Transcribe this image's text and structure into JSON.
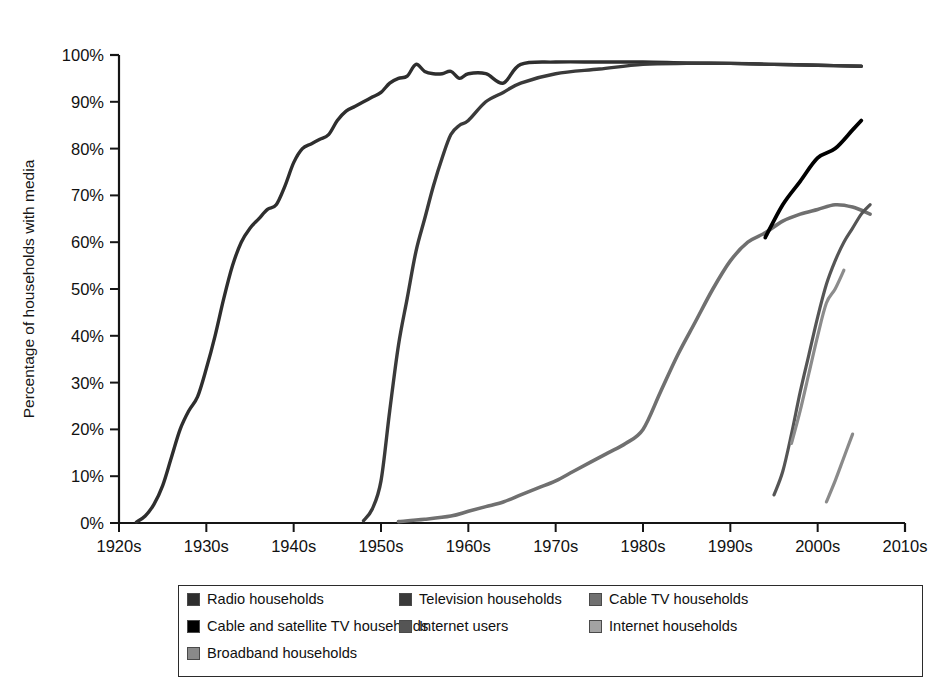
{
  "chart_data": {
    "type": "line",
    "title": "",
    "subtitle": "",
    "xlabel": "",
    "ylabel": "Percentage of households with media",
    "xlim": [
      1920,
      2010
    ],
    "ylim": [
      0,
      100
    ],
    "grid": false,
    "legend_position": "bottom",
    "x_tick_labels": [
      "1920s",
      "1930s",
      "1940s",
      "1950s",
      "1960s",
      "1970s",
      "1980s",
      "1990s",
      "2000s",
      "2010s"
    ],
    "x_tick_values": [
      1920,
      1930,
      1940,
      1950,
      1960,
      1970,
      1980,
      1990,
      2000,
      2010
    ],
    "y_tick_labels": [
      "0%",
      "10%",
      "20%",
      "30%",
      "40%",
      "50%",
      "60%",
      "70%",
      "80%",
      "90%",
      "100%"
    ],
    "y_tick_values": [
      0,
      10,
      20,
      30,
      40,
      50,
      60,
      70,
      80,
      90,
      100
    ],
    "series": [
      {
        "name": "Radio households",
        "color": "#2e2e2e",
        "width": 3.4,
        "x": [
          1922,
          1923,
          1924,
          1925,
          1926,
          1927,
          1928,
          1929,
          1930,
          1931,
          1932,
          1933,
          1934,
          1935,
          1936,
          1937,
          1938,
          1939,
          1940,
          1941,
          1942,
          1943,
          1944,
          1945,
          1946,
          1947,
          1948,
          1949,
          1950,
          1951,
          1952,
          1953,
          1954,
          1955,
          1956,
          1957,
          1958,
          1959,
          1960,
          1962,
          1964,
          1966,
          1970,
          1975,
          1980,
          1985,
          1990,
          1995,
          2000,
          2005
        ],
        "y": [
          0.2,
          1.5,
          4,
          8,
          14,
          20,
          24,
          27,
          33,
          40,
          48,
          55,
          60,
          63,
          65,
          67,
          68,
          72,
          77,
          80,
          81,
          82,
          83,
          86,
          88,
          89,
          90,
          91,
          92,
          94,
          95,
          95.5,
          98,
          96.5,
          96,
          96,
          96.5,
          95,
          96,
          96,
          94,
          98,
          98.5,
          98.5,
          98.5,
          98.3,
          98.2,
          98,
          97.8,
          97.6
        ]
      },
      {
        "name": "Television households",
        "color": "#3a3a3a",
        "width": 3.4,
        "x": [
          1948,
          1949,
          1950,
          1951,
          1952,
          1953,
          1954,
          1955,
          1956,
          1957,
          1958,
          1959,
          1960,
          1962,
          1964,
          1966,
          1970,
          1975,
          1980,
          1985,
          1990,
          1995,
          2000,
          2005
        ],
        "y": [
          0.5,
          3,
          9,
          24,
          38,
          48,
          58,
          65,
          72,
          78,
          83,
          85,
          86,
          90,
          92,
          94,
          96,
          97,
          98,
          98.2,
          98.2,
          98,
          97.8,
          97.6
        ]
      },
      {
        "name": "Cable TV households",
        "color": "#707070",
        "width": 3.6,
        "x": [
          1952,
          1955,
          1958,
          1960,
          1962,
          1964,
          1966,
          1968,
          1970,
          1972,
          1974,
          1976,
          1978,
          1980,
          1982,
          1984,
          1986,
          1988,
          1990,
          1992,
          1994,
          1996,
          1998,
          2000,
          2002,
          2004,
          2006
        ],
        "y": [
          0.3,
          0.8,
          1.5,
          2.5,
          3.5,
          4.5,
          6,
          7.5,
          9,
          11,
          13,
          15,
          17,
          20,
          28,
          36,
          43,
          50,
          56,
          60,
          62,
          64.5,
          66,
          67,
          68,
          67.5,
          66
        ]
      },
      {
        "name": "Cable and satellite TV households",
        "color": "#000000",
        "width": 3.8,
        "x": [
          1994,
          1996,
          1998,
          2000,
          2002,
          2004,
          2005
        ],
        "y": [
          61,
          68,
          73,
          78,
          80,
          84,
          86
        ]
      },
      {
        "name": "Internet users",
        "color": "#555555",
        "width": 3.2,
        "x": [
          1995,
          1996,
          1997,
          1998,
          1999,
          2000,
          2001,
          2002,
          2003,
          2004,
          2005,
          2006
        ],
        "y": [
          6,
          11,
          19,
          28,
          36,
          44,
          51,
          56,
          60,
          63,
          66,
          68
        ]
      },
      {
        "name": "Internet households",
        "color": "#8c8c8c",
        "width": 3.2,
        "x": [
          1997,
          1998,
          1999,
          2000,
          2001,
          2002,
          2003
        ],
        "y": [
          17,
          24,
          32,
          40,
          47,
          50,
          54
        ]
      },
      {
        "name": "Broadband households",
        "color": "#8a8a8a",
        "width": 3.2,
        "x": [
          2001,
          2002,
          2003,
          2004
        ],
        "y": [
          4.5,
          9,
          14,
          19
        ]
      }
    ]
  },
  "legend": {
    "rows": [
      [
        {
          "label": "Radio households",
          "color": "#2e2e2e"
        },
        {
          "label": "Television households",
          "color": "#3a3a3a"
        },
        {
          "label": "Cable TV households",
          "color": "#707070"
        }
      ],
      [
        {
          "label": "Cable and satellite TV households",
          "color": "#000000"
        },
        {
          "label": "Internet users",
          "color": "#555555"
        },
        {
          "label": "Internet households",
          "color": "#a3a3a3"
        }
      ],
      [
        {
          "label": "Broadband households",
          "color": "#8a8a8a"
        }
      ]
    ]
  }
}
